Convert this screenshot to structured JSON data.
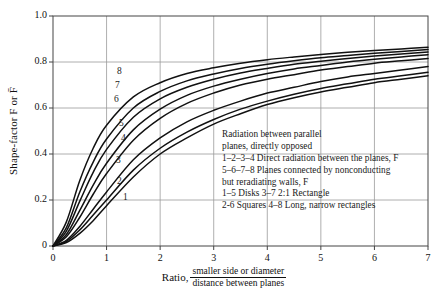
{
  "chart_data": {
    "type": "line",
    "title": "",
    "xlabel_prefix": "Ratio,",
    "xlabel_numerator": "smaller side or diameter",
    "xlabel_denominator": "distance between planes",
    "ylabel": "Shape-factor F or F̄",
    "xlim": [
      0,
      7
    ],
    "ylim": [
      0,
      1.0
    ],
    "xticks": [
      "0",
      "1",
      "2",
      "3",
      "4",
      "5",
      "6",
      "7"
    ],
    "yticks": [
      "0",
      "0.2",
      "0.4",
      "0.6",
      "0.8",
      "1.0"
    ],
    "grid": true,
    "legend_position": "inside-right",
    "series": [
      {
        "name": "1",
        "label": "1",
        "description": "Disks — direct radiation between the planes, F",
        "x": [
          0,
          0.25,
          0.5,
          0.75,
          1.0,
          1.5,
          2.0,
          2.5,
          3.0,
          3.5,
          4.0,
          4.5,
          5.0,
          5.5,
          6.0,
          6.5,
          7.0
        ],
        "y": [
          0.0,
          0.015,
          0.055,
          0.11,
          0.175,
          0.3,
          0.4,
          0.47,
          0.53,
          0.575,
          0.615,
          0.645,
          0.67,
          0.69,
          0.71,
          0.725,
          0.74
        ]
      },
      {
        "name": "2",
        "label": "2",
        "description": "Squares — direct radiation between the planes, F",
        "x": [
          0,
          0.25,
          0.5,
          0.75,
          1.0,
          1.5,
          2.0,
          2.5,
          3.0,
          3.5,
          4.0,
          4.5,
          5.0,
          5.5,
          6.0,
          6.5,
          7.0
        ],
        "y": [
          0.0,
          0.02,
          0.07,
          0.135,
          0.2,
          0.33,
          0.425,
          0.495,
          0.55,
          0.595,
          0.63,
          0.66,
          0.685,
          0.705,
          0.725,
          0.74,
          0.755
        ]
      },
      {
        "name": "3",
        "label": "3",
        "description": "2:1 Rectangle — direct radiation between the planes, F",
        "x": [
          0,
          0.25,
          0.5,
          0.75,
          1.0,
          1.5,
          2.0,
          2.5,
          3.0,
          3.5,
          4.0,
          4.5,
          5.0,
          5.5,
          6.0,
          6.5,
          7.0
        ],
        "y": [
          0.0,
          0.025,
          0.085,
          0.16,
          0.235,
          0.375,
          0.47,
          0.54,
          0.59,
          0.63,
          0.665,
          0.69,
          0.715,
          0.735,
          0.75,
          0.765,
          0.78
        ]
      },
      {
        "name": "4",
        "label": "4",
        "description": "Long, narrow rectangles — direct radiation between the planes, F",
        "x": [
          0,
          0.25,
          0.5,
          0.75,
          1.0,
          1.5,
          2.0,
          2.5,
          3.0,
          3.5,
          4.0,
          4.5,
          5.0,
          5.5,
          6.0,
          6.5,
          7.0
        ],
        "y": [
          0.0,
          0.04,
          0.125,
          0.225,
          0.315,
          0.46,
          0.555,
          0.62,
          0.665,
          0.7,
          0.725,
          0.745,
          0.765,
          0.78,
          0.795,
          0.805,
          0.815
        ]
      },
      {
        "name": "5",
        "label": "5",
        "description": "Disks — planes connected by nonconducting but reradiating walls, F̄",
        "x": [
          0,
          0.25,
          0.5,
          0.75,
          1.0,
          1.5,
          2.0,
          2.5,
          3.0,
          3.5,
          4.0,
          4.5,
          5.0,
          5.5,
          6.0,
          6.5,
          7.0
        ],
        "y": [
          0.0,
          0.05,
          0.155,
          0.265,
          0.36,
          0.505,
          0.595,
          0.655,
          0.695,
          0.725,
          0.75,
          0.77,
          0.785,
          0.8,
          0.812,
          0.822,
          0.832
        ]
      },
      {
        "name": "6",
        "label": "6",
        "description": "Squares — planes connected by nonconducting but reradiating walls, F̄",
        "x": [
          0,
          0.25,
          0.5,
          0.75,
          1.0,
          1.5,
          2.0,
          2.5,
          3.0,
          3.5,
          4.0,
          4.5,
          5.0,
          5.5,
          6.0,
          6.5,
          7.0
        ],
        "y": [
          0.0,
          0.065,
          0.195,
          0.32,
          0.42,
          0.56,
          0.64,
          0.69,
          0.725,
          0.752,
          0.772,
          0.79,
          0.803,
          0.815,
          0.826,
          0.835,
          0.843
        ]
      },
      {
        "name": "7",
        "label": "7",
        "description": "2:1 Rectangle — planes connected by nonconducting but reradiating walls, F̄",
        "x": [
          0,
          0.25,
          0.5,
          0.75,
          1.0,
          1.5,
          2.0,
          2.5,
          3.0,
          3.5,
          4.0,
          4.5,
          5.0,
          5.5,
          6.0,
          6.5,
          7.0
        ],
        "y": [
          0.0,
          0.08,
          0.235,
          0.365,
          0.465,
          0.6,
          0.672,
          0.718,
          0.748,
          0.772,
          0.79,
          0.805,
          0.818,
          0.828,
          0.838,
          0.846,
          0.854
        ]
      },
      {
        "name": "8",
        "label": "8",
        "description": "Long, narrow rectangles — planes connected by nonconducting but reradiating walls, F̄",
        "x": [
          0,
          0.25,
          0.5,
          0.75,
          1.0,
          1.5,
          2.0,
          2.5,
          3.0,
          3.5,
          4.0,
          4.5,
          5.0,
          5.5,
          6.0,
          6.5,
          7.0
        ],
        "y": [
          0.0,
          0.105,
          0.285,
          0.425,
          0.525,
          0.648,
          0.71,
          0.75,
          0.775,
          0.795,
          0.81,
          0.822,
          0.833,
          0.842,
          0.85,
          0.857,
          0.864
        ]
      }
    ],
    "curve_labels": [
      {
        "text": "8",
        "x_px": 117,
        "y_px": 66
      },
      {
        "text": "7",
        "x_px": 115,
        "y_px": 80
      },
      {
        "text": "6",
        "x_px": 114,
        "y_px": 94
      },
      {
        "text": "5",
        "x_px": 119,
        "y_px": 118
      },
      {
        "text": "4",
        "x_px": 121,
        "y_px": 133
      },
      {
        "text": "3",
        "x_px": 116,
        "y_px": 155
      },
      {
        "text": "2",
        "x_px": 117,
        "y_px": 176
      },
      {
        "text": "1",
        "x_px": 123,
        "y_px": 192
      }
    ],
    "annotations": [
      "Radiation between parallel",
      "planes, directly opposed",
      "1–2–3–4 Direct radiation between the planes, F",
      "5–6–7–8 Planes connected by nonconducting",
      "but reradiating walls, F",
      "1–5 Disks 3–7 2:1 Rectangle",
      "2-6 Squares 4–8 Long, narrow rectangles"
    ],
    "colors": {
      "curve": "#111111",
      "grid": "#9a9a9a",
      "axis": "#444444",
      "background": "#ffffff",
      "text": "#111111"
    }
  }
}
